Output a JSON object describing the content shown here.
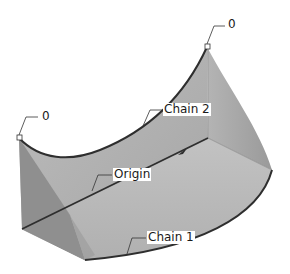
{
  "figure": {
    "type": "cad-surface-diagram",
    "labels": {
      "top_right_vertex": "0",
      "left_vertex": "0",
      "chain_2": "Chain 2",
      "origin": "Origin",
      "chain_1": "Chain 1"
    },
    "colors": {
      "background": "#ffffff",
      "surface_light": "#c4c4c4",
      "surface_mid": "#ababab",
      "surface_dark": "#8e8e8e",
      "edge": "#2e2e2e"
    }
  }
}
